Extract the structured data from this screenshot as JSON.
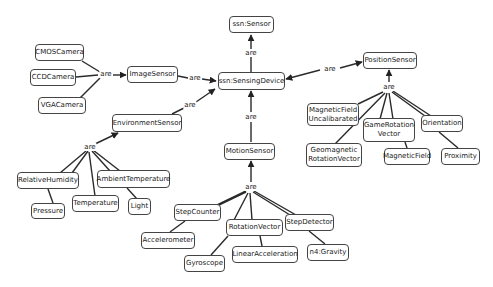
{
  "diagram": {
    "relation_label": "are",
    "nodes": {
      "sensor": "ssn:Sensor",
      "sensing_device": "ssn:SensingDevice",
      "cmos_camera": "CMOSCamera",
      "ccd_camera": "CCDCamera",
      "vga_camera": "VGACamera",
      "image_sensor": "ImageSensor",
      "environment_sensor": "EnvironmentSensor",
      "position_sensor": "PositionSensor",
      "magnetic_field_uncal_1": "MagneticField",
      "magnetic_field_uncal_2": "Uncalibarated",
      "game_rotation_1": "GameRotation",
      "game_rotation_2": "Vector",
      "orientation": "Orientation",
      "geomagnetic_1": "Geomagnetic",
      "geomagnetic_2": "RotationVector",
      "magnetic_field": "MagneticField",
      "proximity": "Proximity",
      "motion_sensor": "MotionSensor",
      "relative_humidity": "RelativeHumidity",
      "ambient_temperature": "AmbientTemperature",
      "pressure": "Pressure",
      "temperature": "Temperature",
      "light": "Light",
      "step_counter": "StepCounter",
      "rotation_vector": "RotationVector",
      "step_detector": "StepDetector",
      "accelerometer": "Accelerometer",
      "gyroscope": "Gyroscope",
      "linear_acceleration": "LinearAcceleration",
      "gravity": "n4:Gravity"
    },
    "edges": [
      {
        "from": "ssn:SensingDevice",
        "to": "ssn:Sensor",
        "label": "are"
      },
      {
        "from": "ImageSensor",
        "to": "ssn:SensingDevice",
        "label": "are"
      },
      {
        "from": "EnvironmentSensor",
        "to": "ssn:SensingDevice",
        "label": "are"
      },
      {
        "from": "MotionSensor",
        "to": "ssn:SensingDevice",
        "label": "are"
      },
      {
        "from": "PositionSensor",
        "to": "ssn:SensingDevice",
        "label": "are",
        "bidirectional": true
      },
      {
        "from": [
          "CMOSCamera",
          "CCDCamera",
          "VGACamera"
        ],
        "to": "ImageSensor",
        "label": "are"
      },
      {
        "from": [
          "RelativeHumidity",
          "Pressure",
          "Temperature",
          "AmbientTemperature",
          "Light"
        ],
        "to": "EnvironmentSensor",
        "label": "are"
      },
      {
        "from": [
          "MagneticField Uncalibarated",
          "Geomagnetic RotationVector",
          "GameRotation Vector",
          "MagneticField",
          "Orientation",
          "Proximity"
        ],
        "to": "PositionSensor",
        "label": "are"
      },
      {
        "from": [
          "StepCounter",
          "Accelerometer",
          "RotationVector",
          "Gyroscope",
          "LinearAcceleration",
          "StepDetector",
          "n4:Gravity"
        ],
        "to": "MotionSensor",
        "label": "are"
      }
    ]
  }
}
